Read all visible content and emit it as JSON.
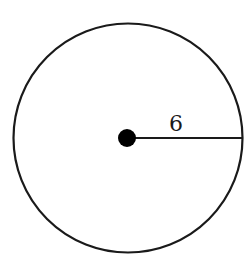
{
  "diagram": {
    "type": "circle-with-radius",
    "radius_label": "6",
    "stroke_color": "#1a1a1a",
    "background": "#ffffff"
  }
}
